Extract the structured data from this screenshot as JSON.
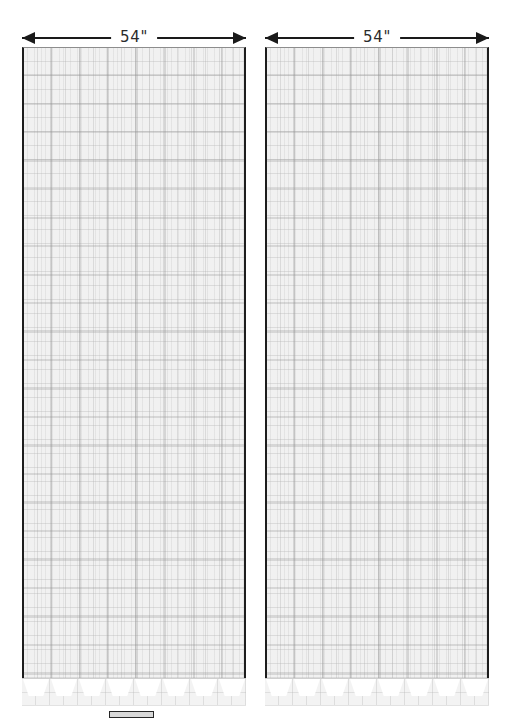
{
  "diagram": {
    "dimensions": [
      {
        "id": "left-panel-width",
        "label": "54\"",
        "value": 54,
        "unit": "inch"
      },
      {
        "id": "right-panel-width",
        "label": "54\"",
        "value": 54,
        "unit": "inch"
      }
    ],
    "panels": [
      {
        "id": "left-panel",
        "name": "Left Curtain Panel",
        "width_label": "54\"",
        "fabric": "plaid-grid"
      },
      {
        "id": "right-panel",
        "name": "Right Curtain Panel",
        "width_label": "54\"",
        "fabric": "plaid-grid"
      }
    ],
    "hem": {
      "style": "scalloped-notched",
      "notch_count": 8
    },
    "swatch": {
      "name": "fabric-swatch",
      "color": "#262626"
    },
    "colors": {
      "panel_border": "#1d1d1d",
      "fabric_base": "#f1f1f1",
      "grid_line": "#afafaf",
      "dimension_line": "#1a1a1a",
      "label_text": "#2b2b2b",
      "background": "#ffffff"
    }
  }
}
